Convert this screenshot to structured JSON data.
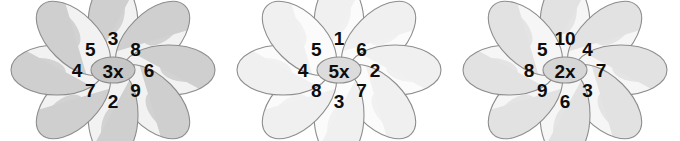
{
  "worksheet": {
    "title": "Multiplication Flowers",
    "flower_count": 3
  },
  "palette": {
    "petal_light": "#f4f4f4",
    "petal_mid": "#e4e4e4",
    "petal_dark": "#c9c9c9",
    "outline": "#8d8d8d",
    "hub_dark": "#c6c6c6",
    "hub_mid": "#dedede",
    "hub_light": "#ededed",
    "text": "#0d0d0d",
    "background": "#ffffff"
  },
  "flowers": [
    {
      "id": "flower-1",
      "hub_label": "3x",
      "multiplier": 3,
      "shade": "dark",
      "petal_fill": "#cfcfcf",
      "petal_outer_fill": "#f2f2f2",
      "hub_fill": "#c6c6c6",
      "petals": [
        {
          "position": "top",
          "angle": -90,
          "value": "3"
        },
        {
          "position": "top-right",
          "angle": -45,
          "value": "8"
        },
        {
          "position": "right",
          "angle": 0,
          "value": "6"
        },
        {
          "position": "bottom-right",
          "angle": 45,
          "value": "9"
        },
        {
          "position": "bottom",
          "angle": 90,
          "value": "2"
        },
        {
          "position": "bottom-left",
          "angle": 135,
          "value": "7"
        },
        {
          "position": "left",
          "angle": 180,
          "value": "4"
        },
        {
          "position": "top-left",
          "angle": -135,
          "value": "5"
        }
      ]
    },
    {
      "id": "flower-2",
      "hub_label": "5x",
      "multiplier": 5,
      "shade": "light",
      "petal_fill": "#f0f0f0",
      "petal_outer_fill": "#fbfbfb",
      "hub_fill": "#dcdcdc",
      "petals": [
        {
          "position": "top",
          "angle": -90,
          "value": "1"
        },
        {
          "position": "top-right",
          "angle": -45,
          "value": "6"
        },
        {
          "position": "right",
          "angle": 0,
          "value": "2"
        },
        {
          "position": "bottom-right",
          "angle": 45,
          "value": "7"
        },
        {
          "position": "bottom",
          "angle": 90,
          "value": "3"
        },
        {
          "position": "bottom-left",
          "angle": 135,
          "value": "8"
        },
        {
          "position": "left",
          "angle": 180,
          "value": "4"
        },
        {
          "position": "top-left",
          "angle": -135,
          "value": "5"
        }
      ]
    },
    {
      "id": "flower-3",
      "hub_label": "2x",
      "multiplier": 2,
      "shade": "medium",
      "petal_fill": "#e2e2e2",
      "petal_outer_fill": "#f6f6f6",
      "hub_fill": "#d6d6d6",
      "petals": [
        {
          "position": "top",
          "angle": -90,
          "value": "10"
        },
        {
          "position": "top-right",
          "angle": -45,
          "value": "4"
        },
        {
          "position": "right",
          "angle": 0,
          "value": "7"
        },
        {
          "position": "bottom-right",
          "angle": 45,
          "value": "3"
        },
        {
          "position": "bottom",
          "angle": 90,
          "value": "6"
        },
        {
          "position": "bottom-left",
          "angle": 135,
          "value": "9"
        },
        {
          "position": "left",
          "angle": 180,
          "value": "8"
        },
        {
          "position": "top-left",
          "angle": -135,
          "value": "5"
        }
      ]
    }
  ]
}
